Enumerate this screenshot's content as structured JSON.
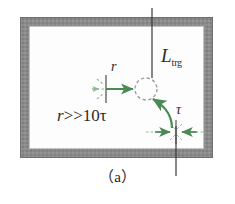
{
  "figure": {
    "caption": "（a）",
    "labels": {
      "trigger_length_symbol": "L",
      "trigger_length_subscript": "trg",
      "radius_symbol": "r",
      "tau_symbol": "τ",
      "relation_lhs": "r",
      "relation_text": ">>10τ"
    },
    "colors": {
      "frame_gray": "#8a8a8a",
      "frame_gray_dark": "#7a7a7a",
      "arrow_green": "#4a8a55",
      "dashed_green": "#8fb894",
      "line_dark": "#3a3a3a",
      "circle_gray": "#9a9a9a",
      "background": "#ffffff"
    },
    "geometry": {
      "frame_left": 20,
      "frame_top": 17,
      "frame_right": 213,
      "frame_bottom": 158,
      "frame_thickness": 9,
      "circle_center_x": 146,
      "circle_center_y": 89,
      "circle_radius": 11,
      "top_line_x": 152,
      "bottom_line_x": 176
    }
  }
}
